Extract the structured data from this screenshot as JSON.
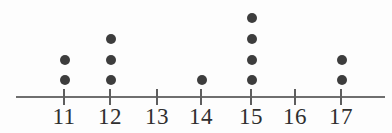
{
  "chart_data": {
    "type": "dotplot",
    "title": "",
    "subtitle": "",
    "xlabel": "",
    "ylabel": "",
    "categories": [
      "11",
      "12",
      "13",
      "14",
      "15",
      "16",
      "17"
    ],
    "values": [
      2,
      3,
      0,
      1,
      4,
      0,
      2
    ],
    "tick_labels": [
      "11",
      "12",
      "13",
      "14",
      "15",
      "16",
      "17"
    ],
    "xlim": [
      10.5,
      17.5
    ],
    "grid": false,
    "legend": null,
    "annotations": [],
    "total_count": 12,
    "dot_color": "#3d3d3d",
    "axis_color": "#6f6f6f",
    "background_color": "#fdfdfd",
    "points": [
      {
        "category": "11",
        "count": 2
      },
      {
        "category": "12",
        "count": 3
      },
      {
        "category": "13",
        "count": 0
      },
      {
        "category": "14",
        "count": 1
      },
      {
        "category": "15",
        "count": 4
      },
      {
        "category": "16",
        "count": 0
      },
      {
        "category": "17",
        "count": 2
      }
    ],
    "layout": {
      "axis_y": 96,
      "axis_left": 16,
      "axis_right": 385,
      "tick_x": [
        64,
        110,
        157,
        201,
        251,
        295,
        341
      ],
      "dot_row_y": [
        80,
        60,
        39,
        18
      ],
      "dot_diameter": 10
    }
  }
}
